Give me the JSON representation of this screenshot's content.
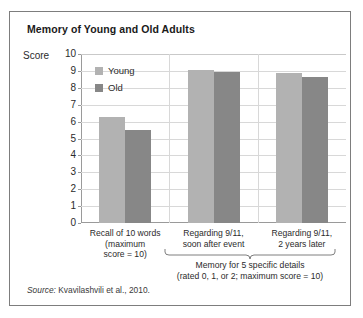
{
  "chart_data": {
    "type": "bar",
    "title": "Memory of Young and Old Adults",
    "xlabel": "",
    "ylabel": "Score",
    "ylim": [
      0,
      10
    ],
    "yticks": [
      10,
      9,
      8,
      7,
      6,
      5,
      4,
      3,
      2,
      1,
      0
    ],
    "grid": true,
    "legend_position": "top-left-inside",
    "categories": [
      "Recall of 10 words\n(maximum\nscore = 10)",
      "Regarding 9/11,\nsoon after event",
      "Regarding 9/11,\n2 years later"
    ],
    "category_lines": [
      [
        "Recall of 10 words",
        "(maximum",
        "score = 10)"
      ],
      [
        "Regarding 9/11,",
        "soon after event"
      ],
      [
        "Regarding 9/11,",
        "2 years later"
      ]
    ],
    "series": [
      {
        "name": "Young",
        "color": "#b2b2b2",
        "values": [
          6.3,
          9.05,
          8.85
        ]
      },
      {
        "name": "Old",
        "color": "#878787",
        "values": [
          5.5,
          8.95,
          8.65
        ]
      }
    ],
    "annotations": [
      "Memory for 5 specific details",
      "(rated 0, 1, or 2; maximum score = 10)"
    ],
    "source_prefix": "Source:",
    "source_text": "Kvavilashvili et al., 2010."
  },
  "legend": {
    "items": [
      {
        "label": "Young",
        "color": "#b2b2b2"
      },
      {
        "label": "Old",
        "color": "#878787"
      }
    ]
  },
  "colors": {
    "young": "#b2b2b2",
    "old": "#878787",
    "frame": "#7d7d7d",
    "gridline": "#d8d8d8",
    "axis": "#9a9a9a",
    "text": "#2b2b2b"
  }
}
